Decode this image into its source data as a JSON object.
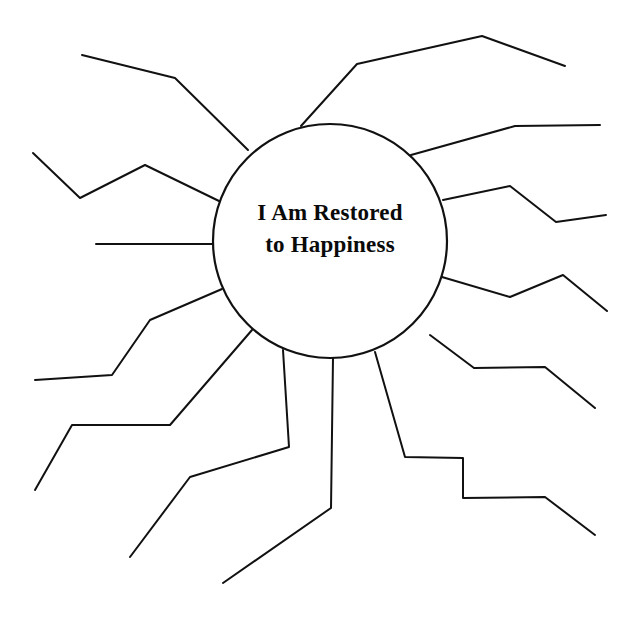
{
  "page": {
    "background_color": "#ffffff",
    "width": 639,
    "height": 629
  },
  "hub": {
    "line1": "I Am Restored",
    "line2": "to Happiness",
    "full_text": "I Am Restored to Happiness",
    "center_x": 330,
    "center_y": 241,
    "radius": 117,
    "stroke_color": "#111111",
    "stroke_width": 2.2,
    "fill_color": "#ffffff",
    "text_color": "#0a0a0a",
    "font_size": 23,
    "line1_y": 215,
    "line2_y": 247
  },
  "style": {
    "spoke_stroke_color": "#111111",
    "spoke_stroke_width": 2.0
  },
  "chart_data": {
    "type": "diagram",
    "diagram_kind": "radial-web-organizer",
    "title": "I Am Restored to Happiness",
    "hub_label": "I Am Restored to Happiness",
    "spoke_count": 12,
    "spokes": [
      {
        "id": "spoke-1",
        "name": "spoke-upper-left-long",
        "clock_position": "10 o'clock",
        "points": [
          [
            248,
            150
          ],
          [
            175,
            78
          ],
          [
            82,
            55
          ]
        ]
      },
      {
        "id": "spoke-2",
        "name": "spoke-left-upper",
        "clock_position": "9-10 o'clock",
        "points": [
          [
            219,
            201
          ],
          [
            145,
            165
          ],
          [
            80,
            198
          ],
          [
            33,
            153
          ]
        ]
      },
      {
        "id": "spoke-3",
        "name": "spoke-left-horizontal",
        "clock_position": "9 o'clock",
        "points": [
          [
            213,
            244
          ],
          [
            96,
            244
          ]
        ]
      },
      {
        "id": "spoke-4",
        "name": "spoke-left-lower",
        "clock_position": "8 o'clock",
        "points": [
          [
            222,
            289
          ],
          [
            150,
            320
          ],
          [
            112,
            375
          ],
          [
            35,
            380
          ]
        ]
      },
      {
        "id": "spoke-5",
        "name": "spoke-lower-left",
        "clock_position": "7-8 o'clock",
        "points": [
          [
            252,
            330
          ],
          [
            170,
            425
          ],
          [
            72,
            425
          ],
          [
            35,
            490
          ]
        ]
      },
      {
        "id": "spoke-6",
        "name": "spoke-lower-left-steep",
        "clock_position": "7 o'clock",
        "points": [
          [
            283,
            350
          ],
          [
            289,
            447
          ],
          [
            190,
            477
          ],
          [
            130,
            557
          ]
        ]
      },
      {
        "id": "spoke-7",
        "name": "spoke-bottom",
        "clock_position": "6 o'clock",
        "points": [
          [
            333,
            358
          ],
          [
            331,
            508
          ],
          [
            223,
            583
          ]
        ]
      },
      {
        "id": "spoke-8",
        "name": "spoke-lower-right",
        "clock_position": "5 o'clock",
        "points": [
          [
            375,
            352
          ],
          [
            405,
            457
          ],
          [
            463,
            458
          ],
          [
            463,
            498
          ],
          [
            545,
            497
          ],
          [
            595,
            535
          ]
        ]
      },
      {
        "id": "spoke-9",
        "name": "spoke-right-lower",
        "clock_position": "4-5 o'clock",
        "points": [
          [
            430,
            335
          ],
          [
            474,
            368
          ],
          [
            545,
            367
          ],
          [
            595,
            408
          ]
        ]
      },
      {
        "id": "spoke-10",
        "name": "spoke-right-middle",
        "clock_position": "4 o'clock",
        "points": [
          [
            442,
            277
          ],
          [
            510,
            297
          ],
          [
            563,
            275
          ],
          [
            607,
            311
          ]
        ]
      },
      {
        "id": "spoke-11",
        "name": "spoke-right-upper",
        "clock_position": "3 o'clock",
        "points": [
          [
            443,
            200
          ],
          [
            510,
            186
          ],
          [
            556,
            222
          ],
          [
            606,
            215
          ]
        ]
      },
      {
        "id": "spoke-12",
        "name": "spoke-upper-right",
        "clock_position": "2 o'clock",
        "points": [
          [
            411,
            155
          ],
          [
            515,
            126
          ],
          [
            600,
            125
          ]
        ]
      },
      {
        "id": "spoke-13",
        "name": "spoke-top-long",
        "clock_position": "12-1 o'clock",
        "points": [
          [
            301,
            126
          ],
          [
            357,
            64
          ],
          [
            482,
            36
          ],
          [
            565,
            66
          ]
        ]
      }
    ]
  }
}
